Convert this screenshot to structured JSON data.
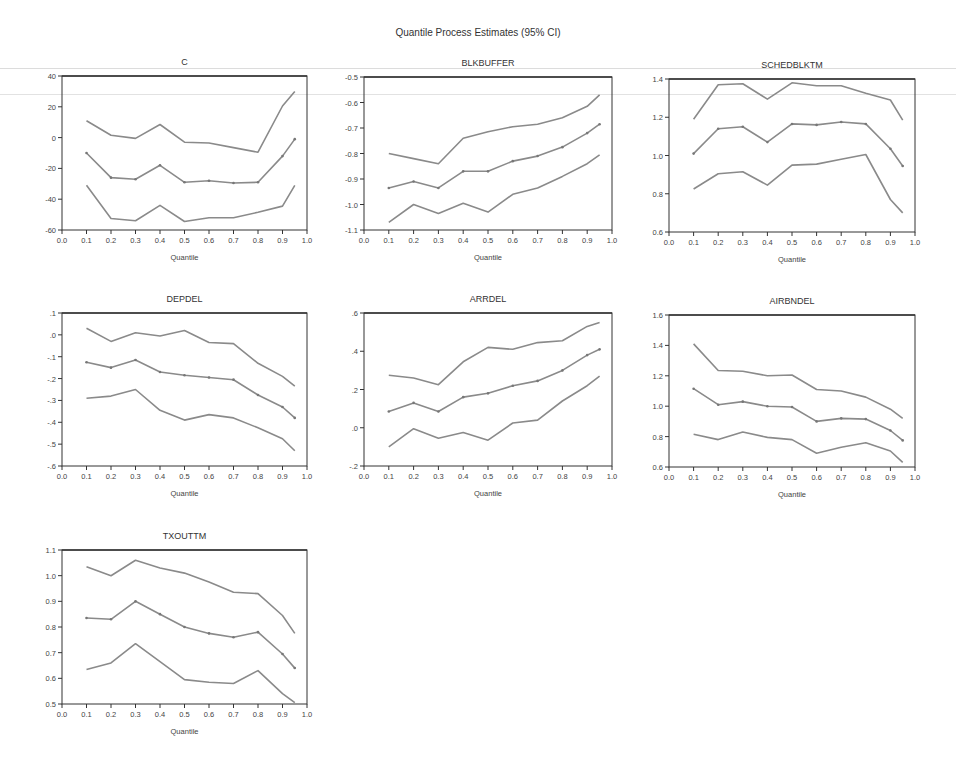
{
  "page": {
    "title": "Quantile Process Estimates (95% CI)"
  },
  "chart_data": [
    {
      "type": "line",
      "title": "C",
      "xlabel": "Quantile",
      "ylabel": "",
      "xlim": [
        0.0,
        1.0
      ],
      "ylim": [
        -60,
        40
      ],
      "xticks": [
        "0.0",
        "0.1",
        "0.2",
        "0.3",
        "0.4",
        "0.5",
        "0.6",
        "0.7",
        "0.8",
        "0.9",
        "1.0"
      ],
      "yticks": [
        "-60",
        "-40",
        "-20",
        "0",
        "20",
        "40"
      ],
      "ytick_values": [
        -60,
        -40,
        -20,
        0,
        20,
        40
      ],
      "x": [
        0.1,
        0.2,
        0.3,
        0.4,
        0.5,
        0.6,
        0.7,
        0.8,
        0.9,
        0.95
      ],
      "series": [
        {
          "name": "Upper 95% CI",
          "values": [
            11,
            1.5,
            -0.5,
            8.5,
            -3,
            -3.5,
            -6.5,
            -9.5,
            20.5,
            30
          ]
        },
        {
          "name": "Estimate",
          "values": [
            -10,
            -26,
            -27,
            -18,
            -29,
            -28,
            -29.5,
            -29,
            -12,
            -1
          ]
        },
        {
          "name": "Lower 95% CI",
          "values": [
            -31,
            -52.5,
            -54,
            -44,
            -54.5,
            -52,
            -52,
            -48.5,
            -44.5,
            -31
          ]
        }
      ],
      "grid": false,
      "legend": "none"
    },
    {
      "type": "line",
      "title": "BLKBUFFER",
      "xlabel": "Quantile",
      "ylabel": "",
      "xlim": [
        0.0,
        1.0
      ],
      "ylim": [
        -1.1,
        -0.5
      ],
      "xticks": [
        "0.0",
        "0.1",
        "0.2",
        "0.3",
        "0.4",
        "0.5",
        "0.6",
        "0.7",
        "0.8",
        "0.9",
        "1.0"
      ],
      "yticks": [
        "-1.1",
        "-1.0",
        "-0.9",
        "-0.8",
        "-0.7",
        "-0.6",
        "-0.5"
      ],
      "ytick_values": [
        -1.1,
        -1.0,
        -0.9,
        -0.8,
        -0.7,
        -0.6,
        -0.5
      ],
      "x": [
        0.1,
        0.2,
        0.3,
        0.4,
        0.5,
        0.6,
        0.7,
        0.8,
        0.9,
        0.95
      ],
      "series": [
        {
          "name": "Upper 95% CI",
          "values": [
            -0.8,
            -0.82,
            -0.84,
            -0.74,
            -0.715,
            -0.695,
            -0.685,
            -0.66,
            -0.615,
            -0.57
          ]
        },
        {
          "name": "Estimate",
          "values": [
            -0.935,
            -0.91,
            -0.935,
            -0.87,
            -0.87,
            -0.83,
            -0.81,
            -0.775,
            -0.72,
            -0.685
          ]
        },
        {
          "name": "Lower 95% CI",
          "values": [
            -1.07,
            -1.0,
            -1.035,
            -0.995,
            -1.03,
            -0.96,
            -0.935,
            -0.89,
            -0.84,
            -0.805
          ]
        }
      ],
      "grid": false,
      "legend": "none"
    },
    {
      "type": "line",
      "title": "SCHEDBLKTM",
      "xlabel": "Quantile",
      "ylabel": "",
      "xlim": [
        0.0,
        1.0
      ],
      "ylim": [
        0.6,
        1.4
      ],
      "xticks": [
        "0.0",
        "0.1",
        "0.2",
        "0.3",
        "0.4",
        "0.5",
        "0.6",
        "0.7",
        "0.8",
        "0.9",
        "1.0"
      ],
      "yticks": [
        "0.6",
        "0.8",
        "1.0",
        "1.2",
        "1.4"
      ],
      "ytick_values": [
        0.6,
        0.8,
        1.0,
        1.2,
        1.4
      ],
      "x": [
        0.1,
        0.2,
        0.3,
        0.4,
        0.5,
        0.6,
        0.7,
        0.8,
        0.9,
        0.95
      ],
      "series": [
        {
          "name": "Upper 95% CI",
          "values": [
            1.19,
            1.37,
            1.375,
            1.295,
            1.38,
            1.365,
            1.365,
            1.325,
            1.29,
            1.185
          ]
        },
        {
          "name": "Estimate",
          "values": [
            1.01,
            1.14,
            1.15,
            1.07,
            1.165,
            1.16,
            1.175,
            1.165,
            1.035,
            0.945
          ]
        },
        {
          "name": "Lower 95% CI",
          "values": [
            0.825,
            0.905,
            0.915,
            0.845,
            0.95,
            0.955,
            0.98,
            1.005,
            0.77,
            0.7
          ]
        }
      ],
      "grid": false,
      "legend": "none"
    },
    {
      "type": "line",
      "title": "DEPDEL",
      "xlabel": "Quantile",
      "ylabel": "",
      "xlim": [
        0.0,
        1.0
      ],
      "ylim": [
        -0.6,
        0.1
      ],
      "xticks": [
        "0.0",
        "0.1",
        "0.2",
        "0.3",
        "0.4",
        "0.5",
        "0.6",
        "0.7",
        "0.8",
        "0.9",
        "1.0"
      ],
      "yticks": [
        "-.6",
        "-.5",
        "-.4",
        "-.3",
        "-.2",
        "-.1",
        ".0",
        ".1"
      ],
      "ytick_values": [
        -0.6,
        -0.5,
        -0.4,
        -0.3,
        -0.2,
        -0.1,
        0.0,
        0.1
      ],
      "x": [
        0.1,
        0.2,
        0.3,
        0.4,
        0.5,
        0.6,
        0.7,
        0.8,
        0.9,
        0.95
      ],
      "series": [
        {
          "name": "Upper 95% CI",
          "values": [
            0.03,
            -0.03,
            0.01,
            -0.005,
            0.02,
            -0.035,
            -0.04,
            -0.13,
            -0.19,
            -0.235
          ]
        },
        {
          "name": "Estimate",
          "values": [
            -0.125,
            -0.15,
            -0.115,
            -0.17,
            -0.185,
            -0.195,
            -0.205,
            -0.275,
            -0.33,
            -0.38
          ]
        },
        {
          "name": "Lower 95% CI",
          "values": [
            -0.29,
            -0.28,
            -0.25,
            -0.345,
            -0.39,
            -0.365,
            -0.38,
            -0.425,
            -0.475,
            -0.53
          ]
        }
      ],
      "grid": false,
      "legend": "none"
    },
    {
      "type": "line",
      "title": "ARRDEL",
      "xlabel": "Quantile",
      "ylabel": "",
      "xlim": [
        0.0,
        1.0
      ],
      "ylim": [
        -0.2,
        0.6
      ],
      "xticks": [
        "0.0",
        "0.1",
        "0.2",
        "0.3",
        "0.4",
        "0.5",
        "0.6",
        "0.7",
        "0.8",
        "0.9",
        "1.0"
      ],
      "yticks": [
        "-.2",
        ".0",
        ".2",
        ".4",
        ".6"
      ],
      "ytick_values": [
        -0.2,
        0.0,
        0.2,
        0.4,
        0.6
      ],
      "x": [
        0.1,
        0.2,
        0.3,
        0.4,
        0.5,
        0.6,
        0.7,
        0.8,
        0.9,
        0.95
      ],
      "series": [
        {
          "name": "Upper 95% CI",
          "values": [
            0.275,
            0.26,
            0.225,
            0.345,
            0.42,
            0.41,
            0.445,
            0.455,
            0.53,
            0.55
          ]
        },
        {
          "name": "Estimate",
          "values": [
            0.085,
            0.13,
            0.085,
            0.16,
            0.18,
            0.22,
            0.245,
            0.3,
            0.38,
            0.41
          ]
        },
        {
          "name": "Lower 95% CI",
          "values": [
            -0.1,
            -0.005,
            -0.055,
            -0.025,
            -0.065,
            0.025,
            0.04,
            0.14,
            0.22,
            0.27
          ]
        }
      ],
      "grid": false,
      "legend": "none"
    },
    {
      "type": "line",
      "title": "AIRBNDEL",
      "xlabel": "Quantile",
      "ylabel": "",
      "xlim": [
        0.0,
        1.0
      ],
      "ylim": [
        0.6,
        1.6
      ],
      "xticks": [
        "0.0",
        "0.1",
        "0.2",
        "0.3",
        "0.4",
        "0.5",
        "0.6",
        "0.7",
        "0.8",
        "0.9",
        "1.0"
      ],
      "yticks": [
        "0.6",
        "0.8",
        "1.0",
        "1.2",
        "1.4",
        "1.6"
      ],
      "ytick_values": [
        0.6,
        0.8,
        1.0,
        1.2,
        1.4,
        1.6
      ],
      "x": [
        0.1,
        0.2,
        0.3,
        0.4,
        0.5,
        0.6,
        0.7,
        0.8,
        0.9,
        0.95
      ],
      "series": [
        {
          "name": "Upper 95% CI",
          "values": [
            1.41,
            1.235,
            1.23,
            1.2,
            1.205,
            1.11,
            1.1,
            1.06,
            0.98,
            0.92
          ]
        },
        {
          "name": "Estimate",
          "values": [
            1.115,
            1.01,
            1.03,
            1.0,
            0.995,
            0.9,
            0.92,
            0.915,
            0.84,
            0.775
          ]
        },
        {
          "name": "Lower 95% CI",
          "values": [
            0.815,
            0.78,
            0.83,
            0.795,
            0.78,
            0.69,
            0.73,
            0.76,
            0.705,
            0.63
          ]
        }
      ],
      "grid": false,
      "legend": "none"
    },
    {
      "type": "line",
      "title": "TXOUTTM",
      "xlabel": "Quantile",
      "ylabel": "",
      "xlim": [
        0.0,
        1.0
      ],
      "ylim": [
        0.5,
        1.1
      ],
      "xticks": [
        "0.0",
        "0.1",
        "0.2",
        "0.3",
        "0.4",
        "0.5",
        "0.6",
        "0.7",
        "0.8",
        "0.9",
        "1.0"
      ],
      "yticks": [
        "0.5",
        "0.6",
        "0.7",
        "0.8",
        "0.9",
        "1.0",
        "1.1"
      ],
      "ytick_values": [
        0.5,
        0.6,
        0.7,
        0.8,
        0.9,
        1.0,
        1.1
      ],
      "x": [
        0.1,
        0.2,
        0.3,
        0.4,
        0.5,
        0.6,
        0.7,
        0.8,
        0.9,
        0.95
      ],
      "series": [
        {
          "name": "Upper 95% CI",
          "values": [
            1.035,
            1.0,
            1.06,
            1.03,
            1.01,
            0.975,
            0.935,
            0.93,
            0.845,
            0.775
          ]
        },
        {
          "name": "Estimate",
          "values": [
            0.835,
            0.83,
            0.9,
            0.85,
            0.8,
            0.775,
            0.76,
            0.78,
            0.695,
            0.64
          ]
        },
        {
          "name": "Lower 95% CI",
          "values": [
            0.635,
            0.66,
            0.735,
            0.665,
            0.595,
            0.585,
            0.58,
            0.63,
            0.54,
            0.505
          ]
        }
      ],
      "grid": false,
      "legend": "none"
    }
  ],
  "style": {
    "line_color": "#8a8a8a",
    "axis_color": "#333333",
    "text_color": "#444444"
  }
}
